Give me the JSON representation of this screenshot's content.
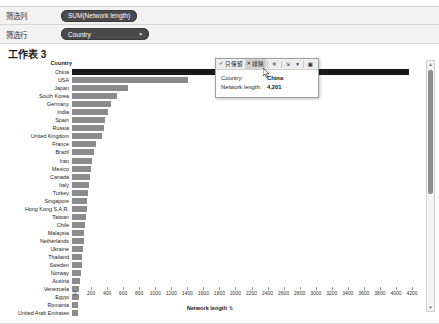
{
  "shelves": {
    "columns": {
      "label": "筛选列",
      "pill": "SUM(Network length)"
    },
    "rows": {
      "label": "筛选行",
      "pill": "Country",
      "caret": "▾"
    }
  },
  "sheet": {
    "title": "工作表 3"
  },
  "viz": {
    "row_header": "Country",
    "axis_title": "Network length",
    "axis_sort_glyph": "⇅"
  },
  "tooltip": {
    "keep_only": "只保留",
    "keep_only_icon": "✓",
    "exclude": "排除",
    "exclude_icon": "✕",
    "group_icon": "⁜",
    "sort_icon": "⇲",
    "caret_icon": "▾",
    "view_icon": "▣",
    "rows": [
      {
        "key": "Country:",
        "value": "China"
      },
      {
        "key": "Network length:",
        "value": "4,201"
      }
    ]
  },
  "scrollbar": {
    "up": "▲",
    "down": "▼"
  },
  "chart_data": {
    "type": "bar",
    "title": "工作表 3",
    "orientation": "horizontal",
    "xlabel": "Network length",
    "ylabel": "Country",
    "xlim": [
      0,
      4200
    ],
    "xticks": [
      0,
      200,
      400,
      600,
      800,
      1000,
      1200,
      1400,
      1600,
      1800,
      2000,
      2200,
      2400,
      2600,
      2800,
      3000,
      3200,
      3400,
      3600,
      3800,
      4000,
      4200
    ],
    "grid": true,
    "legend": "none",
    "highlight_category": "China",
    "categories": [
      "China",
      "USA",
      "Japan",
      "South Korea",
      "Germany",
      "India",
      "Spain",
      "Russia",
      "United Kingdom",
      "France",
      "Brazil",
      "Iran",
      "Mexico",
      "Canada",
      "Italy",
      "Turkey",
      "Singapore",
      "Hong Kong S.A.R.",
      "Taiwan",
      "Chile",
      "Malaysia",
      "Netherlands",
      "Ukraine",
      "Thailand",
      "Sweden",
      "Norway",
      "Austria",
      "Venezuela",
      "Egypt",
      "Romania",
      "United Arab Emirates"
    ],
    "values": [
      4201,
      1450,
      700,
      560,
      480,
      450,
      415,
      400,
      370,
      300,
      270,
      255,
      240,
      225,
      215,
      200,
      190,
      185,
      175,
      160,
      150,
      145,
      140,
      130,
      120,
      110,
      100,
      92,
      85,
      78,
      70
    ]
  }
}
